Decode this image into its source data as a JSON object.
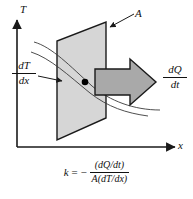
{
  "figure": {
    "background_color": "#ffffff",
    "axes": {
      "y_label": "T",
      "x_label": "x",
      "axis_color": "#1a1a1a"
    },
    "labels": {
      "area_label": "A",
      "gradient_numerator": "dT",
      "gradient_denominator": "dx",
      "heat_flow_numerator": "dQ",
      "heat_flow_denominator": "dt"
    },
    "equation": {
      "lhs": "k",
      "equals": "=",
      "minus": "−",
      "fraction_numerator": "(dQ/dt)",
      "fraction_denominator": "A(dT/dx)"
    },
    "colors": {
      "plane_fill": "#d6d6d6",
      "plane_stroke": "#1a1a1a",
      "arrow_fill": "#a9a9a9",
      "arrow_stroke": "#1a1a1a",
      "isotherm_stroke": "#3a3a3a",
      "point_fill": "#000000",
      "leader_stroke": "#1a1a1a"
    }
  },
  "geometry": {
    "plane_polygon": "106,22 106,118 57,140 57,41",
    "arrow_polygon": "95,69 130,69 130,59 156,82 130,105 130,95 95,95",
    "point": {
      "cx": 85,
      "cy": 82,
      "r": 3.2
    },
    "y_axis": {
      "x": 17,
      "y_top": 18,
      "y_bottom": 147
    },
    "x_axis": {
      "y": 147,
      "x_left": 17,
      "x_right": 177
    }
  }
}
